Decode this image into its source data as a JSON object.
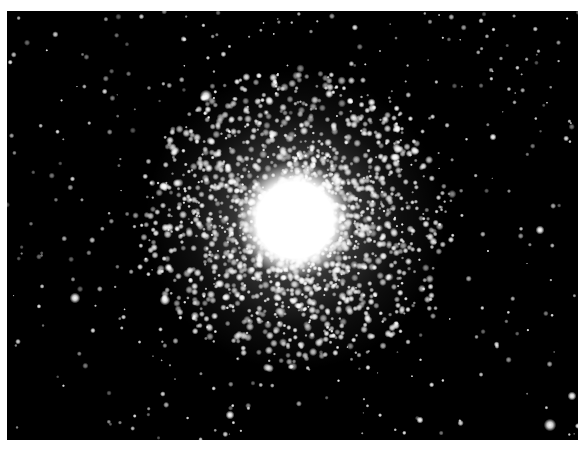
{
  "image": {
    "subject": "globular star cluster",
    "background_color": "#000000",
    "border_color": "#ffffff",
    "frame": {
      "x": 7,
      "y": 11,
      "width": 571,
      "height": 429
    },
    "cluster_core": {
      "x": 295,
      "y": 220,
      "core_radius": 42,
      "halo_radius": 150
    },
    "bright_field_stars": [
      {
        "x": 206,
        "y": 96,
        "r": 3.5
      },
      {
        "x": 75,
        "y": 298,
        "r": 3
      },
      {
        "x": 165,
        "y": 300,
        "r": 3
      },
      {
        "x": 540,
        "y": 230,
        "r": 2.5
      },
      {
        "x": 550,
        "y": 425,
        "r": 3.5
      },
      {
        "x": 572,
        "y": 396,
        "r": 2.5
      },
      {
        "x": 230,
        "y": 415,
        "r": 2.5
      },
      {
        "x": 493,
        "y": 137,
        "r": 2
      },
      {
        "x": 420,
        "y": 420,
        "r": 2
      }
    ]
  }
}
